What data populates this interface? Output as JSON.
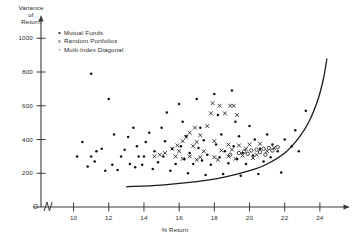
{
  "chart_data": {
    "type": "scatter",
    "title": "",
    "xlabel": "% Return",
    "ylabel": "Variance of Return",
    "ylabel_lines": [
      "Variance",
      "of",
      "Return"
    ],
    "xlim": [
      9,
      25.2
    ],
    "ylim": [
      0,
      1120
    ],
    "xticks": [
      10,
      12,
      14,
      16,
      18,
      20,
      22,
      24
    ],
    "yticks": [
      200,
      400,
      600,
      800,
      1000
    ],
    "grid": false,
    "axis_break": true,
    "origin_label": "O",
    "legend_position": "top-left",
    "legend": [
      {
        "marker": "dot",
        "label": "Mutual Funds"
      },
      {
        "marker": "x",
        "label": "Random Portfolios"
      },
      {
        "marker": "circle",
        "label": "Multi-Index  Diagonal"
      }
    ],
    "series": [
      {
        "name": "Mutual Funds",
        "marker": "dot",
        "points": [
          [
            11.0,
            790
          ],
          [
            12.0,
            640
          ],
          [
            12.3,
            430
          ],
          [
            11.6,
            345
          ],
          [
            11.3,
            330
          ],
          [
            11.0,
            300
          ],
          [
            12.7,
            300
          ],
          [
            12.2,
            250
          ],
          [
            13.1,
            415
          ],
          [
            13.4,
            470
          ],
          [
            13.7,
            300
          ],
          [
            13.2,
            255
          ],
          [
            13.9,
            250
          ],
          [
            14.1,
            385
          ],
          [
            14.3,
            440
          ],
          [
            14.6,
            330
          ],
          [
            14.0,
            300
          ],
          [
            14.8,
            265
          ],
          [
            15.0,
            470
          ],
          [
            15.3,
            560
          ],
          [
            15.2,
            390
          ],
          [
            15.6,
            345
          ],
          [
            15.1,
            300
          ],
          [
            15.8,
            255
          ],
          [
            16.0,
            610
          ],
          [
            16.2,
            505
          ],
          [
            16.4,
            420
          ],
          [
            16.1,
            360
          ],
          [
            16.6,
            320
          ],
          [
            16.3,
            285
          ],
          [
            16.8,
            255
          ],
          [
            17.0,
            640
          ],
          [
            17.2,
            470
          ],
          [
            17.4,
            395
          ],
          [
            17.1,
            350
          ],
          [
            17.6,
            310
          ],
          [
            17.3,
            275
          ],
          [
            17.8,
            250
          ],
          [
            18.0,
            670
          ],
          [
            18.2,
            545
          ],
          [
            18.4,
            430
          ],
          [
            18.1,
            370
          ],
          [
            18.6,
            330
          ],
          [
            18.3,
            295
          ],
          [
            18.8,
            260
          ],
          [
            19.0,
            690
          ],
          [
            19.2,
            505
          ],
          [
            19.4,
            420
          ],
          [
            19.1,
            360
          ],
          [
            19.6,
            320
          ],
          [
            19.3,
            285
          ],
          [
            19.8,
            255
          ],
          [
            20.0,
            480
          ],
          [
            20.3,
            400
          ],
          [
            20.6,
            345
          ],
          [
            20.2,
            305
          ],
          [
            20.8,
            270
          ],
          [
            21.0,
            430
          ],
          [
            21.3,
            370
          ],
          [
            21.6,
            330
          ],
          [
            21.2,
            295
          ],
          [
            22.0,
            400
          ],
          [
            22.4,
            360
          ],
          [
            22.8,
            330
          ],
          [
            21.8,
            205
          ],
          [
            20.5,
            195
          ],
          [
            19.5,
            185
          ],
          [
            18.5,
            195
          ],
          [
            17.5,
            190
          ],
          [
            16.5,
            200
          ],
          [
            15.5,
            215
          ],
          [
            14.5,
            225
          ],
          [
            13.5,
            235
          ],
          [
            12.5,
            220
          ],
          [
            11.8,
            215
          ],
          [
            10.8,
            240
          ],
          [
            10.5,
            385
          ],
          [
            10.2,
            300
          ],
          [
            11.2,
            270
          ],
          [
            12.9,
            340
          ],
          [
            13.6,
            360
          ],
          [
            23.2,
            570
          ],
          [
            22.6,
            455
          ]
        ]
      },
      {
        "name": "Random Portfolios",
        "marker": "x",
        "points": [
          [
            17.9,
            615
          ],
          [
            18.3,
            600
          ],
          [
            18.9,
            600
          ],
          [
            19.1,
            600
          ],
          [
            18.6,
            555
          ],
          [
            17.8,
            555
          ],
          [
            19.3,
            545
          ],
          [
            17.6,
            480
          ],
          [
            16.9,
            470
          ],
          [
            16.6,
            440
          ],
          [
            16.4,
            415
          ],
          [
            17.2,
            425
          ],
          [
            16.2,
            390
          ],
          [
            17.0,
            385
          ],
          [
            15.9,
            365
          ],
          [
            16.8,
            360
          ],
          [
            18.0,
            390
          ],
          [
            18.8,
            370
          ],
          [
            19.4,
            365
          ],
          [
            20.0,
            370
          ],
          [
            20.6,
            375
          ],
          [
            19.8,
            345
          ],
          [
            19.0,
            340
          ],
          [
            18.4,
            335
          ],
          [
            17.4,
            330
          ],
          [
            16.0,
            330
          ],
          [
            15.6,
            345
          ],
          [
            15.2,
            320
          ],
          [
            14.9,
            310
          ],
          [
            14.6,
            300
          ],
          [
            15.8,
            300
          ],
          [
            16.6,
            300
          ],
          [
            17.2,
            295
          ],
          [
            18.0,
            295
          ],
          [
            18.8,
            300
          ],
          [
            19.6,
            305
          ],
          [
            20.4,
            310
          ],
          [
            21.0,
            330
          ],
          [
            21.4,
            350
          ],
          [
            20.2,
            290
          ],
          [
            19.2,
            285
          ],
          [
            18.2,
            280
          ],
          [
            17.0,
            280
          ],
          [
            16.2,
            285
          ]
        ]
      },
      {
        "name": "Multi-Index  Diagonal",
        "marker": "circle",
        "points": [
          [
            19.7,
            330
          ],
          [
            20.1,
            335
          ],
          [
            20.4,
            340
          ],
          [
            20.8,
            345
          ],
          [
            21.1,
            350
          ],
          [
            19.4,
            320
          ],
          [
            19.9,
            315
          ],
          [
            20.6,
            325
          ],
          [
            21.3,
            335
          ],
          [
            18.9,
            310
          ],
          [
            21.6,
            355
          ],
          [
            20.9,
            310
          ]
        ]
      }
    ],
    "frontier": {
      "name": "Efficient Frontier",
      "x": [
        13.0,
        15.0,
        17.0,
        18.5,
        20.0,
        21.0,
        22.0,
        22.8,
        23.4,
        23.9,
        24.2,
        24.4
      ],
      "y": [
        120,
        130,
        150,
        175,
        215,
        255,
        320,
        410,
        510,
        640,
        760,
        880
      ]
    }
  }
}
